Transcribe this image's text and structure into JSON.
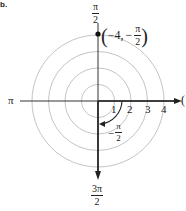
{
  "part_label": "b.",
  "diagram": {
    "type": "polar-grid",
    "center": {
      "x": 98,
      "y": 101
    },
    "ring_radius_unit_px": 16.5,
    "rings": [
      1,
      2,
      3,
      4
    ],
    "ring_color": "#bdbdbd",
    "axis_color": "#222222",
    "angle_labels": {
      "top": {
        "num": "π",
        "den": "2"
      },
      "left": "π",
      "right": "0",
      "bottom": {
        "num": "3π",
        "den": "2"
      }
    },
    "radial_ticks": [
      "1",
      "2",
      "3",
      "4"
    ],
    "point": {
      "label_r": "−4,",
      "label_theta": {
        "sign": "−",
        "num": "π",
        "den": "2"
      },
      "r": -4,
      "theta": "-π/2"
    },
    "angle_arc_label": {
      "sign": "−",
      "num": "π",
      "den": "2"
    }
  }
}
